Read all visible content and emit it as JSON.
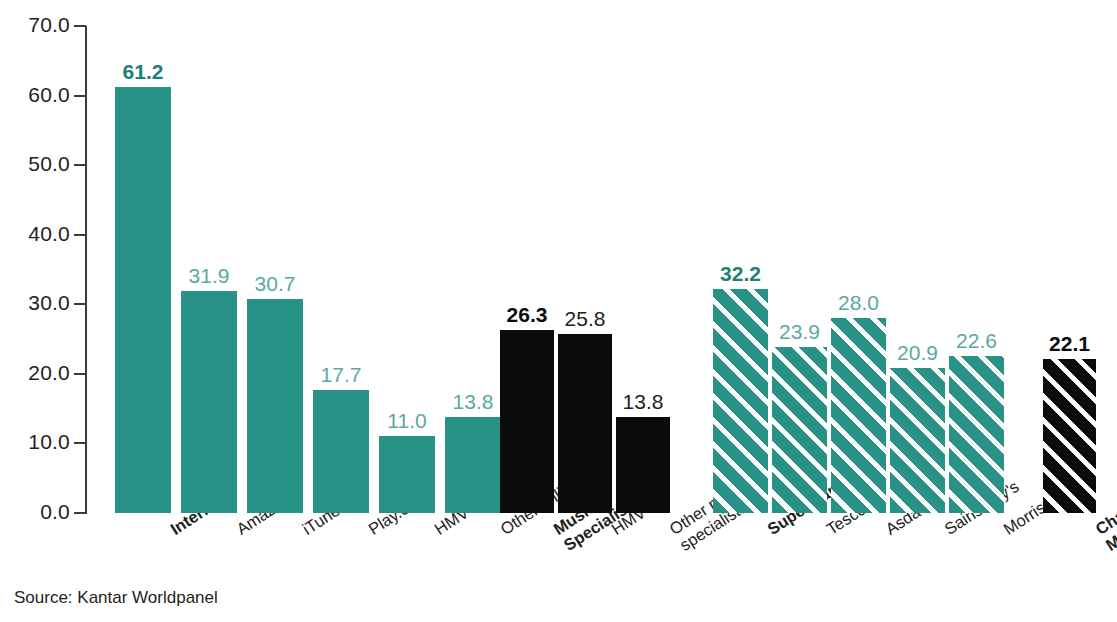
{
  "source_note": "Source: Kantar Worldpanel",
  "colors": {
    "teal": "#279285",
    "teal_label": "#5ba9a1",
    "teal_label_bold": "#1d8175",
    "black": "#0b0b0b",
    "axis": "#3b3b3b",
    "text": "#231f20",
    "background": "#ffffff"
  },
  "chart_data": {
    "type": "bar",
    "title": "",
    "subtitle": "",
    "xlabel": "",
    "ylabel": "",
    "ylim": [
      0.0,
      70.0
    ],
    "ytick_step": 10.0,
    "ytick_labels": [
      "70.0",
      "60.0",
      "50.0",
      "40.0",
      "30.0",
      "20.0",
      "10.0",
      "0.0"
    ],
    "ytick_values": [
      70.0,
      60.0,
      50.0,
      40.0,
      30.0,
      20.0,
      10.0,
      0.0
    ],
    "grid": false,
    "legend": "none",
    "orientation": "vertical",
    "value_label_format": "one-decimal",
    "groups": [
      {
        "name": "internet-group",
        "style": "solid",
        "color": "#279285",
        "categories": [
          "Internet",
          "Amazon",
          "iTunes",
          "Play.com",
          "HMV",
          "Other online"
        ],
        "values": [
          61.2,
          31.9,
          30.7,
          17.7,
          11.0,
          13.8
        ],
        "value_labels": [
          "61.2",
          "31.9",
          "30.7",
          "17.7",
          "11.0",
          "13.8"
        ],
        "emphasis": [
          true,
          false,
          false,
          false,
          false,
          false
        ]
      },
      {
        "name": "music-specialists-group",
        "style": "solid",
        "color": "#0b0b0b",
        "categories": [
          "Music\nSpecialists",
          "HMV",
          "Other music\nspecialists"
        ],
        "values": [
          26.3,
          25.8,
          13.8
        ],
        "value_labels": [
          "26.3",
          "25.8",
          "13.8"
        ],
        "emphasis": [
          true,
          false,
          false
        ]
      },
      {
        "name": "supermarkets-group",
        "style": "hatched",
        "color": "#279285",
        "categories": [
          "Supermarkets",
          "Tesco",
          "Asda",
          "Sainsbury's",
          "Morrisons"
        ],
        "values": [
          32.2,
          23.9,
          28.0,
          20.9,
          22.6
        ],
        "value_labels": [
          "32.2",
          "23.9",
          "28.0",
          "20.9",
          "22.6"
        ],
        "emphasis": [
          true,
          false,
          false,
          false,
          false
        ]
      },
      {
        "name": "chains-multiples-group",
        "style": "hatched",
        "color": "#0b0b0b",
        "categories": [
          "Chains/\nMultiples"
        ],
        "values": [
          22.1
        ],
        "value_labels": [
          "22.1"
        ],
        "emphasis": [
          true
        ]
      }
    ]
  },
  "bars": [
    {
      "group": 0,
      "label": "Internet",
      "value": 61.2,
      "value_label": "61.2",
      "bold": true,
      "fill": "solid-teal",
      "label_class": "teal-bold",
      "x": 115,
      "w": 56
    },
    {
      "group": 0,
      "label": "Amazon",
      "value": 31.9,
      "value_label": "31.9",
      "bold": false,
      "fill": "solid-teal",
      "label_class": "teal",
      "x": 181,
      "w": 56
    },
    {
      "group": 0,
      "label": "iTunes",
      "value": 30.7,
      "value_label": "30.7",
      "bold": false,
      "fill": "solid-teal",
      "label_class": "teal",
      "x": 247,
      "w": 56
    },
    {
      "group": 0,
      "label": "Play.com",
      "value": 17.7,
      "value_label": "17.7",
      "bold": false,
      "fill": "solid-teal",
      "label_class": "teal",
      "x": 313,
      "w": 56
    },
    {
      "group": 0,
      "label": "HMV",
      "value": 11.0,
      "value_label": "11.0",
      "bold": false,
      "fill": "solid-teal",
      "label_class": "teal",
      "x": 379,
      "w": 56
    },
    {
      "group": 0,
      "label": "Other online",
      "value": 13.8,
      "value_label": "13.8",
      "bold": false,
      "fill": "solid-teal",
      "label_class": "teal",
      "x": 445,
      "w": 56
    },
    {
      "group": 1,
      "label": "Music\nSpecialists",
      "value": 26.3,
      "value_label": "26.3",
      "bold": true,
      "fill": "solid-black",
      "label_class": "dark-bold",
      "x": 500,
      "w": 54
    },
    {
      "group": 1,
      "label": "HMV",
      "value": 25.8,
      "value_label": "25.8",
      "bold": false,
      "fill": "solid-black",
      "label_class": "dark",
      "x": 558,
      "w": 54
    },
    {
      "group": 1,
      "label": "Other music\nspecialists",
      "value": 13.8,
      "value_label": "13.8",
      "bold": false,
      "fill": "solid-black",
      "label_class": "dark",
      "x": 616,
      "w": 54
    },
    {
      "group": 2,
      "label": "Supermarkets",
      "value": 32.2,
      "value_label": "32.2",
      "bold": true,
      "fill": "hatch-teal",
      "label_class": "teal-bold",
      "x": 713,
      "w": 55
    },
    {
      "group": 2,
      "label": "Tesco",
      "value": 23.9,
      "value_label": "23.9",
      "bold": false,
      "fill": "hatch-teal",
      "label_class": "teal",
      "x": 772,
      "w": 55
    },
    {
      "group": 2,
      "label": "Asda",
      "value": 28.0,
      "value_label": "28.0",
      "bold": false,
      "fill": "hatch-teal",
      "label_class": "teal",
      "x": 831,
      "w": 55
    },
    {
      "group": 2,
      "label": "Sainsbury's",
      "value": 20.9,
      "value_label": "20.9",
      "bold": false,
      "fill": "hatch-teal",
      "label_class": "teal",
      "x": 890,
      "w": 55
    },
    {
      "group": 2,
      "label": "Morrisons",
      "value": 22.6,
      "value_label": "22.6",
      "bold": false,
      "fill": "hatch-teal",
      "label_class": "teal",
      "x": 949,
      "w": 55
    },
    {
      "group": 3,
      "label": "Chains/\nMultiples",
      "value": 22.1,
      "value_label": "22.1",
      "bold": true,
      "fill": "hatch-black",
      "label_class": "dark-bold",
      "x": 1043,
      "w": 53
    }
  ]
}
